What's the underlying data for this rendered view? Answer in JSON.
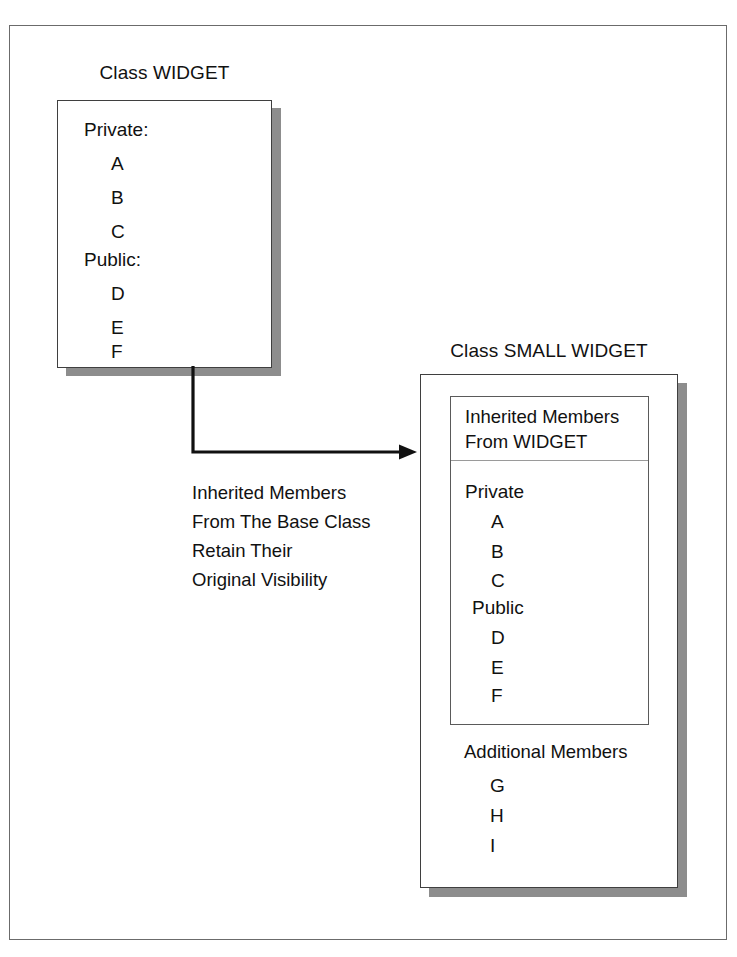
{
  "figure": {
    "kind": "class-inheritance-diagram",
    "frame_border_color": "#6b6b6b",
    "box_border_color": "#3f3f3f",
    "shadow_color": "#8d8d8d",
    "text_color": "#111111",
    "background": "#ffffff"
  },
  "base_class": {
    "title": "Class WIDGET",
    "sections": [
      {
        "heading": "Private:",
        "members": [
          "A",
          "B",
          "C"
        ]
      },
      {
        "heading": "Public:",
        "members": [
          "D",
          "E",
          "F"
        ]
      }
    ]
  },
  "arrow": {
    "caption_lines": [
      "Inherited Members",
      "From The Base Class",
      "Retain Their",
      "Original Visibility"
    ]
  },
  "derived_class": {
    "title": "Class SMALL WIDGET",
    "inherited_block": {
      "header_lines": [
        "Inherited Members",
        "From WIDGET"
      ],
      "sections": [
        {
          "heading": "Private",
          "members": [
            "A",
            "B",
            "C"
          ]
        },
        {
          "heading": "Public",
          "members": [
            "D",
            "E",
            "F"
          ]
        }
      ]
    },
    "additional_block": {
      "heading": "Additional Members",
      "members": [
        "G",
        "H",
        "I"
      ]
    }
  }
}
